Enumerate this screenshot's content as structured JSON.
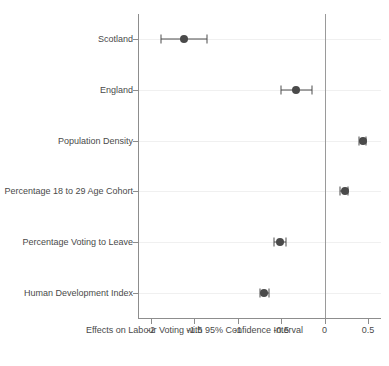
{
  "chart_data": {
    "type": "scatter",
    "subtype": "coefficient-forest-plot",
    "title": "",
    "xlabel": "Effects on Labour Voting with 95% Confidence Interval",
    "ylabel": "",
    "xlim": [
      -2.15,
      0.65
    ],
    "xticks": [
      -2,
      -1.5,
      -1,
      -0.5,
      0,
      0.5
    ],
    "xticklabels": [
      "-2",
      "-1.5",
      "-1",
      "-0.5",
      "0",
      "0.5"
    ],
    "grid": "horizontal-faint",
    "legend": "none",
    "reference_line": 0,
    "categories": [
      "Scotland",
      "England",
      "Population Density",
      "Percentage 18 to 29 Age Cohort",
      "Percentage Voting to Leave",
      "Human Development Index"
    ],
    "points": [
      {
        "label": "Scotland",
        "estimate": -1.62,
        "ci_low": -1.89,
        "ci_high": -1.35
      },
      {
        "label": "England",
        "estimate": -0.33,
        "ci_low": -0.5,
        "ci_high": -0.15
      },
      {
        "label": "Population Density",
        "estimate": 0.44,
        "ci_low": 0.4,
        "ci_high": 0.48
      },
      {
        "label": "Percentage 18 to 29 Age Cohort",
        "estimate": 0.23,
        "ci_low": 0.18,
        "ci_high": 0.27
      },
      {
        "label": "Percentage Voting to Leave",
        "estimate": -0.51,
        "ci_low": -0.58,
        "ci_high": -0.44
      },
      {
        "label": "Human Development Index",
        "estimate": -0.7,
        "ci_low": -0.75,
        "ci_high": -0.64
      }
    ],
    "colors": {
      "marker": "#4a4a4a",
      "error_bar": "#4d4d4d",
      "axis": "#8d8d8d",
      "grid": "#f0f0f0",
      "reference_line": "#9a9a9a",
      "text": "#4a4a4a",
      "background": "#ffffff"
    }
  }
}
